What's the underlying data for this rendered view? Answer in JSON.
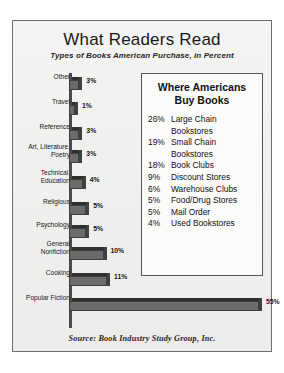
{
  "card": {
    "title": "What Readers Read",
    "subtitle": "Types of Books American Purchase, in Percent",
    "source": "Source:  Book Industry Study Group, Inc."
  },
  "panel": {
    "title_line1": "Where Americans",
    "title_line2": "Buy Books",
    "rows": [
      {
        "pct": "26%",
        "name_line1": "Large Chain",
        "name_line2": "Bookstores"
      },
      {
        "pct": "19%",
        "name_line1": "Small Chain",
        "name_line2": "Bookstores"
      },
      {
        "pct": "18%",
        "name_line1": "Book Clubs",
        "name_line2": ""
      },
      {
        "pct": "9%",
        "name_line1": "Discount Stores",
        "name_line2": ""
      },
      {
        "pct": "6%",
        "name_line1": "Warehouse Clubs",
        "name_line2": ""
      },
      {
        "pct": "5%",
        "name_line1": "Food/Drug Stores",
        "name_line2": ""
      },
      {
        "pct": "5%",
        "name_line1": "Mail Order",
        "name_line2": ""
      },
      {
        "pct": "4%",
        "name_line1": "Used Bookstores",
        "name_line2": ""
      }
    ]
  },
  "chart_data": {
    "type": "bar",
    "orientation": "horizontal",
    "title": "What Readers Read",
    "subtitle": "Types of Books American Purchase, in Percent",
    "xlabel": "",
    "ylabel": "",
    "xlim": [
      0,
      55
    ],
    "grid": false,
    "legend": null,
    "value_suffix": "%",
    "categories": [
      "Other",
      "Travel",
      "Reference",
      "Art, Literature, Poetry",
      "Technical, Education",
      "Religious",
      "Psychology",
      "General Nonfiction",
      "Cooking",
      "Popular Fiction"
    ],
    "values": [
      3,
      1,
      3,
      3,
      4,
      5,
      5,
      10,
      11,
      55
    ],
    "labels": [
      "3%",
      "1%",
      "3%",
      "3%",
      "4%",
      "5%",
      "5%",
      "10%",
      "11%",
      "55%"
    ],
    "category_lines": [
      [
        "Other"
      ],
      [
        "Travel"
      ],
      [
        "Reference"
      ],
      [
        "Art, Literature,",
        "Poetry"
      ],
      [
        "Technical,",
        "Education"
      ],
      [
        "Religious"
      ],
      [
        "Psychology"
      ],
      [
        "General",
        "Nonfiction"
      ],
      [
        "Cooking"
      ],
      [
        "Popular Fiction"
      ]
    ],
    "colors": {
      "bar": "#6b6b6b",
      "bar_top": "#2f2f2f",
      "bar_edge": "#3d3d3d",
      "background": "#f2f2f0"
    },
    "source": "Source:  Book Industry Study Group, Inc.",
    "side_table": {
      "title": "Where Americans Buy Books",
      "type": "table",
      "columns": [
        "percent",
        "outlet"
      ],
      "rows": [
        [
          "26%",
          "Large Chain Bookstores"
        ],
        [
          "19%",
          "Small Chain Bookstores"
        ],
        [
          "18%",
          "Book Clubs"
        ],
        [
          "9%",
          "Discount Stores"
        ],
        [
          "6%",
          "Warehouse Clubs"
        ],
        [
          "5%",
          "Food/Drug Stores"
        ],
        [
          "5%",
          "Mail Order"
        ],
        [
          "4%",
          "Used Bookstores"
        ]
      ]
    }
  }
}
